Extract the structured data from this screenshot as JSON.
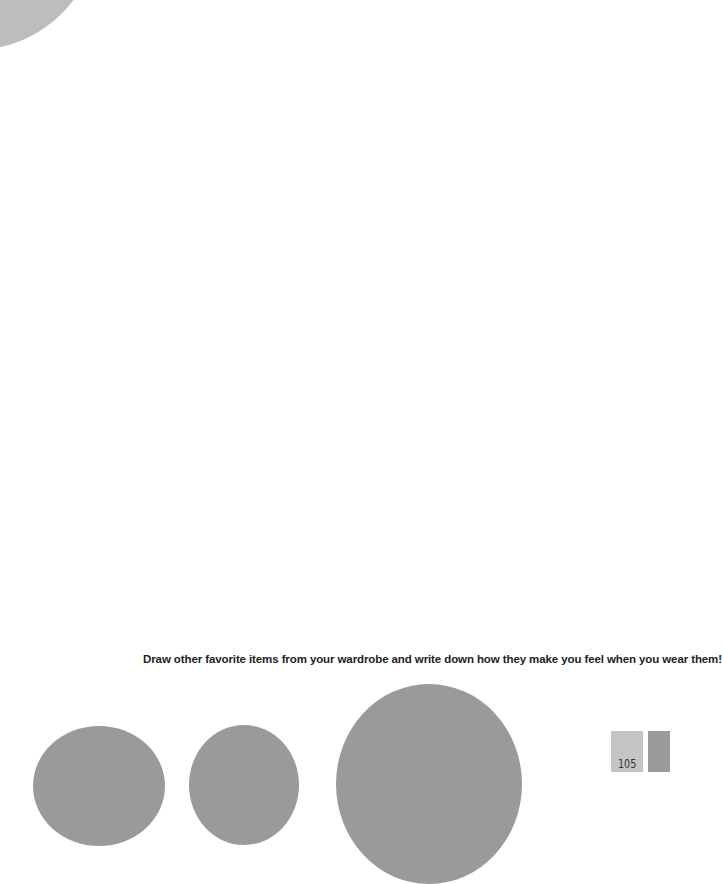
{
  "page": {
    "prompt": "Draw other favorite items from your wardrobe and write down how they make you feel when you wear them!",
    "page_number": "105"
  },
  "colors": {
    "circle_light": "#bdbdbd",
    "circle_dark": "#9a9a9a",
    "tab_light": "#c4c4c4",
    "tab_dark": "#9a9a9a",
    "text": "#222222"
  }
}
